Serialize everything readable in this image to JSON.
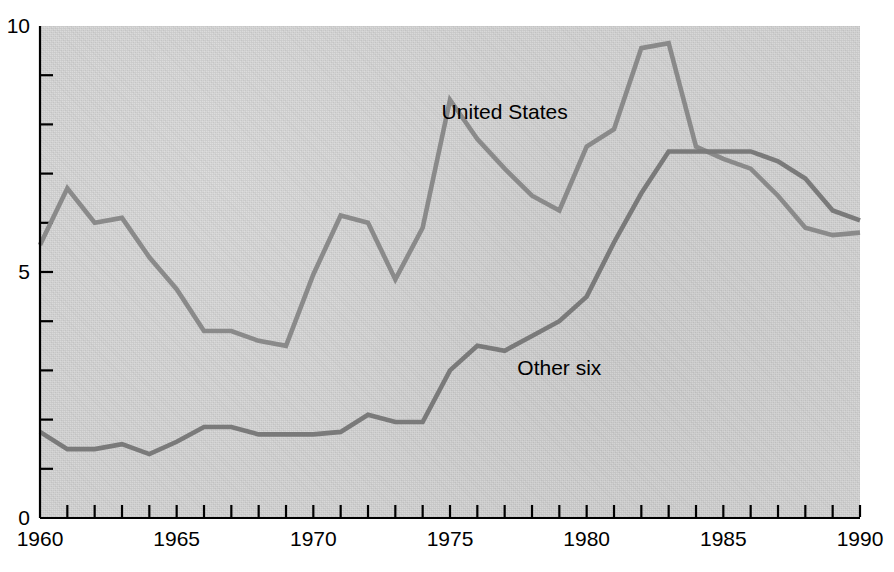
{
  "chart_data": {
    "type": "line",
    "title": "",
    "subtitle": "",
    "xlabel": "",
    "ylabel": "",
    "xlim": [
      1960,
      1990
    ],
    "ylim": [
      0,
      10
    ],
    "grid": false,
    "legend_position": "inline-annotation",
    "x": [
      1960,
      1961,
      1962,
      1963,
      1964,
      1965,
      1966,
      1967,
      1968,
      1969,
      1970,
      1971,
      1972,
      1973,
      1974,
      1975,
      1976,
      1977,
      1978,
      1979,
      1980,
      1981,
      1982,
      1983,
      1984,
      1985,
      1986,
      1987,
      1988,
      1989,
      1990
    ],
    "series": [
      {
        "name": "United States",
        "color": "#8a8a8a",
        "values": [
          5.55,
          6.7,
          6.0,
          6.1,
          5.3,
          4.65,
          3.8,
          3.8,
          3.6,
          3.5,
          4.95,
          6.15,
          6.0,
          4.85,
          5.9,
          8.5,
          7.7,
          7.1,
          6.55,
          6.25,
          7.55,
          7.9,
          9.55,
          9.65,
          7.55,
          7.3,
          7.1,
          6.55,
          5.9,
          5.75,
          5.8
        ]
      },
      {
        "name": "Other six",
        "color": "#7a7a7a",
        "values": [
          1.75,
          1.4,
          1.4,
          1.5,
          1.3,
          1.55,
          1.85,
          1.85,
          1.7,
          1.7,
          1.7,
          1.75,
          2.1,
          1.95,
          1.95,
          3.0,
          3.5,
          3.4,
          3.7,
          4.0,
          4.5,
          5.6,
          6.6,
          7.45,
          7.45,
          7.45,
          7.45,
          7.25,
          6.9,
          6.25,
          6.05
        ]
      }
    ],
    "y_ticks": [
      {
        "value": 0,
        "label": "0"
      },
      {
        "value": 1,
        "label": ""
      },
      {
        "value": 2,
        "label": ""
      },
      {
        "value": 3,
        "label": ""
      },
      {
        "value": 4,
        "label": ""
      },
      {
        "value": 5,
        "label": "5"
      },
      {
        "value": 6,
        "label": ""
      },
      {
        "value": 7,
        "label": ""
      },
      {
        "value": 8,
        "label": ""
      },
      {
        "value": 9,
        "label": ""
      },
      {
        "value": 10,
        "label": "10"
      }
    ],
    "x_ticks": [
      {
        "value": 1960,
        "label": "1960"
      },
      {
        "value": 1961,
        "label": ""
      },
      {
        "value": 1962,
        "label": ""
      },
      {
        "value": 1963,
        "label": ""
      },
      {
        "value": 1964,
        "label": ""
      },
      {
        "value": 1965,
        "label": "1965"
      },
      {
        "value": 1966,
        "label": ""
      },
      {
        "value": 1967,
        "label": ""
      },
      {
        "value": 1968,
        "label": ""
      },
      {
        "value": 1969,
        "label": ""
      },
      {
        "value": 1970,
        "label": "1970"
      },
      {
        "value": 1971,
        "label": ""
      },
      {
        "value": 1972,
        "label": ""
      },
      {
        "value": 1973,
        "label": ""
      },
      {
        "value": 1974,
        "label": ""
      },
      {
        "value": 1975,
        "label": "1975"
      },
      {
        "value": 1976,
        "label": ""
      },
      {
        "value": 1977,
        "label": ""
      },
      {
        "value": 1978,
        "label": ""
      },
      {
        "value": 1979,
        "label": ""
      },
      {
        "value": 1980,
        "label": "1980"
      },
      {
        "value": 1981,
        "label": ""
      },
      {
        "value": 1982,
        "label": ""
      },
      {
        "value": 1983,
        "label": ""
      },
      {
        "value": 1984,
        "label": ""
      },
      {
        "value": 1985,
        "label": "1985"
      },
      {
        "value": 1986,
        "label": ""
      },
      {
        "value": 1987,
        "label": ""
      },
      {
        "value": 1988,
        "label": ""
      },
      {
        "value": 1989,
        "label": ""
      },
      {
        "value": 1990,
        "label": "1990"
      }
    ],
    "annotations": [
      {
        "text": "United States",
        "x": 1977.0,
        "y": 8.25
      },
      {
        "text": "Other six",
        "x": 1979.0,
        "y": 3.05
      }
    ]
  },
  "style": {
    "plot_background": "#d3d3d3",
    "axis_color": "#000000",
    "page_background": "#ffffff"
  }
}
